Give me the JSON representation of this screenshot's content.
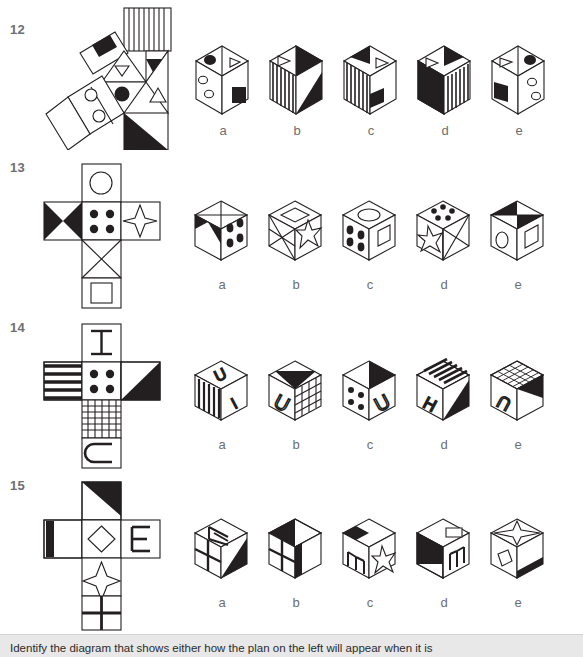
{
  "page": {
    "width": 583,
    "height": 656,
    "background": "#ffffff",
    "ink": "#1a1a1a",
    "label_color": "#6d6e70",
    "footer_bg": "#e8e8e8"
  },
  "footer": {
    "instruction": "Identify the diagram that shows either how the plan on the left will appear when it is"
  },
  "option_labels": [
    "a",
    "b",
    "c",
    "d",
    "e"
  ],
  "questions": [
    {
      "number": "12",
      "net_type": "triangular-prism-net",
      "net_faces": [
        {
          "name": "vertical-stripes-rectangle",
          "pattern": "vertical-stripes"
        },
        {
          "name": "black-square-on-tilted-rectangle",
          "pattern": "black-square"
        },
        {
          "name": "small-white-triangle-in-triangle",
          "pattern": "outline-triangle-down"
        },
        {
          "name": "black-triangle",
          "pattern": "solid-black-triangle"
        },
        {
          "name": "black-dot-circle",
          "pattern": "filled-circle"
        },
        {
          "name": "outline-triangle-up",
          "pattern": "outline-triangle-up"
        },
        {
          "name": "two-small-circles-rectangle",
          "pattern": "two-outline-circles"
        },
        {
          "name": "black-half-square",
          "pattern": "black-lower-triangle"
        },
        {
          "name": "plain-white-square",
          "pattern": "blank"
        }
      ],
      "options": [
        {
          "label": "a",
          "shape": "house-prism",
          "faces": [
            "black-ellipse-and-outline-triangle-top",
            "two-small-circles-left",
            "black-square-lower-right"
          ]
        },
        {
          "label": "b",
          "shape": "house-prism",
          "faces": [
            "outline-triangle-and-black-corner-top",
            "vertical-stripes-left",
            "black-shaded-right"
          ]
        },
        {
          "label": "c",
          "shape": "house-prism",
          "faces": [
            "black-corner-and-outline-triangle-top",
            "vertical-stripes-left",
            "black-notch-right"
          ]
        },
        {
          "label": "d",
          "shape": "house-prism",
          "faces": [
            "outline-triangle-and-black-corner-top",
            "black-shaded-left",
            "vertical-stripes-right"
          ]
        },
        {
          "label": "e",
          "shape": "house-prism",
          "faces": [
            "outline-triangle-and-black-ellipse-top",
            "black-square-left",
            "two-small-circles-right"
          ]
        }
      ]
    },
    {
      "number": "13",
      "net_type": "cross-cube-net",
      "net_faces": [
        {
          "name": "outline-circle-face",
          "pattern": "outline-circle"
        },
        {
          "name": "black-bowtie-face",
          "pattern": "black-bowtie"
        },
        {
          "name": "four-dots-face",
          "pattern": "four-black-dots"
        },
        {
          "name": "four-point-star-face",
          "pattern": "four-point-star"
        },
        {
          "name": "x-cross-face",
          "pattern": "diagonal-cross"
        },
        {
          "name": "outline-square-face",
          "pattern": "outline-square"
        }
      ],
      "options": [
        {
          "label": "a",
          "shape": "cube",
          "faces": [
            "x-cross-top",
            "black-bowtie-left",
            "four-dots-right"
          ]
        },
        {
          "label": "b",
          "shape": "cube",
          "faces": [
            "outline-diamond-top",
            "x-cross-left",
            "four-point-star-right"
          ]
        },
        {
          "label": "c",
          "shape": "cube",
          "faces": [
            "outline-circle-top",
            "four-dots-left",
            "outline-square-right"
          ]
        },
        {
          "label": "d",
          "shape": "cube",
          "faces": [
            "five-dots-top",
            "four-point-star-left",
            "x-cross-right"
          ]
        },
        {
          "label": "e",
          "shape": "cube",
          "faces": [
            "black-bowtie-top",
            "outline-circle-left",
            "outline-square-right"
          ]
        }
      ]
    },
    {
      "number": "14",
      "net_type": "cross-cube-net",
      "net_faces": [
        {
          "name": "letter-I-face",
          "pattern": "letter-I"
        },
        {
          "name": "horizontal-stripes-face",
          "pattern": "horizontal-stripes"
        },
        {
          "name": "four-dots-face",
          "pattern": "four-black-dots"
        },
        {
          "name": "black-triangle-face",
          "pattern": "black-upper-right-triangle"
        },
        {
          "name": "grid-mesh-face",
          "pattern": "grid-mesh"
        },
        {
          "name": "letter-C-face",
          "pattern": "letter-C"
        }
      ],
      "options": [
        {
          "label": "a",
          "shape": "cube",
          "faces": [
            "letter-U-top",
            "vertical-stripes-left",
            "letter-I-right"
          ]
        },
        {
          "label": "b",
          "shape": "cube",
          "faces": [
            "black-triangle-top",
            "letter-U-left",
            "grid-mesh-right"
          ]
        },
        {
          "label": "c",
          "shape": "cube",
          "faces": [
            "black-triangle-top",
            "four-dots-left",
            "letter-U-right"
          ]
        },
        {
          "label": "d",
          "shape": "cube",
          "faces": [
            "horizontal-stripes-top",
            "letter-H-left",
            "black-shaded-right"
          ]
        },
        {
          "label": "e",
          "shape": "cube",
          "faces": [
            "grid-mesh-top",
            "letter-C-left",
            "black-shaded-right"
          ]
        }
      ]
    },
    {
      "number": "15",
      "net_type": "cross-cube-net",
      "net_faces": [
        {
          "name": "black-corner-face",
          "pattern": "black-upper-right-triangle"
        },
        {
          "name": "thick-bar-face",
          "pattern": "thick-left-bar"
        },
        {
          "name": "outline-diamond-face",
          "pattern": "outline-diamond"
        },
        {
          "name": "letter-E-face",
          "pattern": "letter-E"
        },
        {
          "name": "four-point-star-face",
          "pattern": "four-point-star"
        },
        {
          "name": "quad-grid-face",
          "pattern": "quad-grid"
        }
      ],
      "options": [
        {
          "label": "a",
          "shape": "cube",
          "faces": [
            "letter-E-top",
            "quad-grid-left",
            "black-shaded-right"
          ]
        },
        {
          "label": "b",
          "shape": "cube",
          "faces": [
            "black-corner-top",
            "quad-grid-left",
            "black-bar-right"
          ]
        },
        {
          "label": "c",
          "shape": "cube",
          "faces": [
            "black-bar-top",
            "letter-E-left",
            "four-point-star-right"
          ]
        },
        {
          "label": "d",
          "shape": "cube",
          "faces": [
            "black-corner-and-rectangle-top",
            "black-shaded-left",
            "letter-E-right"
          ]
        },
        {
          "label": "e",
          "shape": "cube",
          "faces": [
            "four-point-star-top",
            "tilted-rectangle-left",
            "black-bottom-right"
          ]
        }
      ]
    }
  ]
}
